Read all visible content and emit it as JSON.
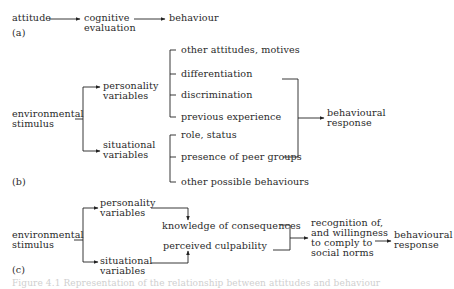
{
  "diagram_a": {
    "label": "(a)",
    "nodes": {
      "attitude": "attitude",
      "cognitive_1": "cognitive",
      "cognitive_2": "evaluation",
      "behaviour": "behaviour"
    }
  },
  "diagram_b": {
    "label": "(b)",
    "stimulus_1": "environmental",
    "stimulus_2": "stimulus",
    "personality_1": "personality",
    "personality_2": "variables",
    "situational_1": "situational",
    "situational_2": "variables",
    "personality_items": [
      "other attitudes, motives",
      "differentiation",
      "discrimination",
      "previous experience"
    ],
    "situational_items": [
      "role, status",
      "presence of peer groups",
      "other possible behaviours"
    ],
    "response_1": "behavioural",
    "response_2": "response"
  },
  "diagram_c": {
    "label": "(c)",
    "stimulus_1": "environmental",
    "stimulus_2": "stimulus",
    "personality_1": "personality",
    "personality_2": "variables",
    "situational_1": "situational",
    "situational_2": "variables",
    "knowledge": "knowledge of consequences",
    "culpability": "perceived culpability",
    "norms": [
      "recognition of,",
      "and willingness",
      "to comply to",
      "social norms"
    ],
    "response_1": "behavioural",
    "response_2": "response"
  },
  "caption": "Figure 4.1 Representation of the relationship between attitudes and behaviour"
}
